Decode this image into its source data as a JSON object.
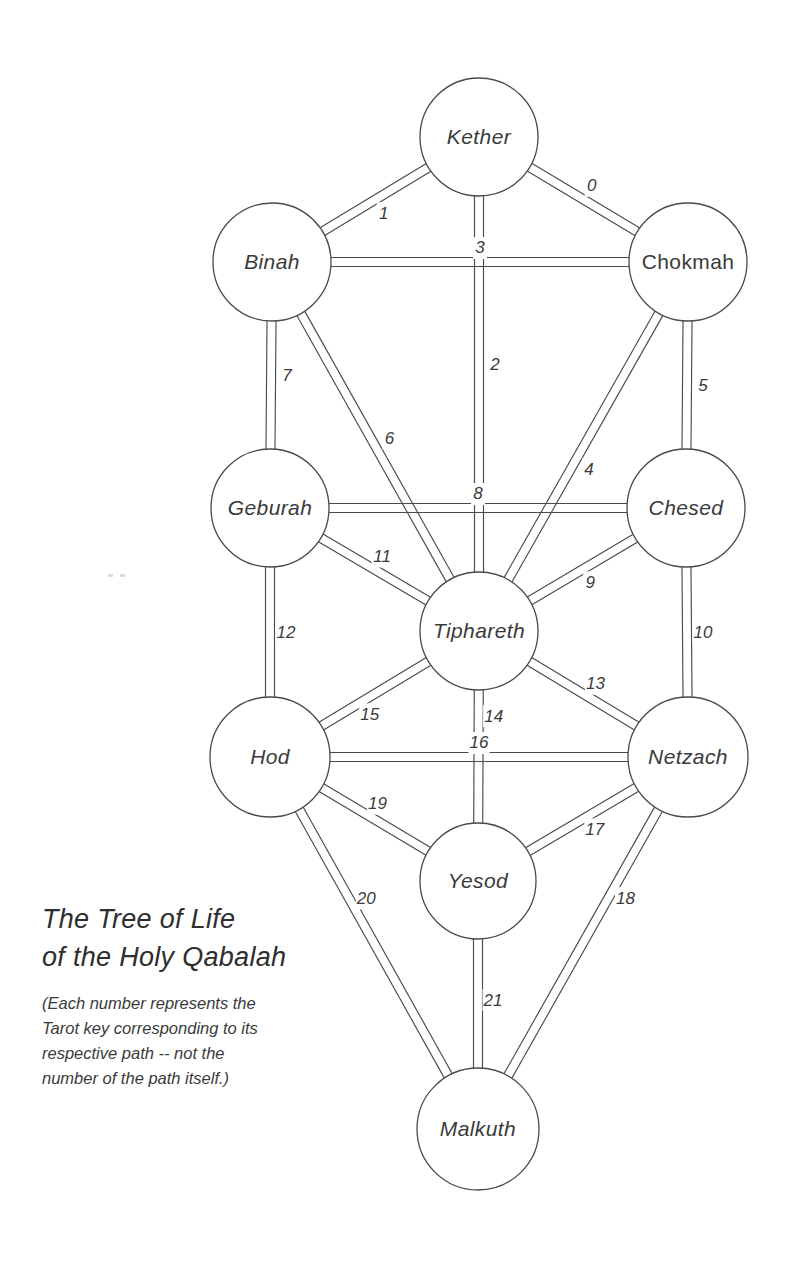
{
  "document": {
    "title_lines": [
      "The Tree of Life",
      "of the Holy Qabalah"
    ],
    "caption_lines": [
      "(Each number represents the",
      "Tarot key corresponding to its",
      "respective path -- not the",
      "number of the path itself.)"
    ]
  },
  "style": {
    "background": "#ffffff",
    "line_color": "#4a4a4a",
    "text_color": "#3a3a3a",
    "rail_gap": 9
  },
  "sephiroth": [
    {
      "id": "kether",
      "label": "Kether",
      "cx": 479,
      "cy": 137,
      "r": 59,
      "italic": true
    },
    {
      "id": "binah",
      "label": "Binah",
      "cx": 272,
      "cy": 262,
      "r": 59,
      "italic": true
    },
    {
      "id": "chokmah",
      "label": "Chokmah",
      "cx": 688,
      "cy": 262,
      "r": 59,
      "italic": false
    },
    {
      "id": "geburah",
      "label": "Geburah",
      "cx": 270,
      "cy": 508,
      "r": 59,
      "italic": true
    },
    {
      "id": "chesed",
      "label": "Chesed",
      "cx": 686,
      "cy": 508,
      "r": 59,
      "italic": true
    },
    {
      "id": "tiphareth",
      "label": "Tiphareth",
      "cx": 479,
      "cy": 631,
      "r": 59,
      "italic": true
    },
    {
      "id": "hod",
      "label": "Hod",
      "cx": 270,
      "cy": 757,
      "r": 60,
      "italic": true
    },
    {
      "id": "netzach",
      "label": "Netzach",
      "cx": 688,
      "cy": 757,
      "r": 60,
      "italic": true
    },
    {
      "id": "yesod",
      "label": "Yesod",
      "cx": 478,
      "cy": 881,
      "r": 58,
      "italic": true
    },
    {
      "id": "malkuth",
      "label": "Malkuth",
      "cx": 478,
      "cy": 1129,
      "r": 61,
      "italic": true
    }
  ],
  "paths": [
    {
      "number": "0",
      "from": "kether",
      "to": "chokmah",
      "lt": 0.5,
      "off": -16
    },
    {
      "number": "1",
      "from": "kether",
      "to": "binah",
      "lt": 0.5,
      "off": -16
    },
    {
      "number": "2",
      "from": "kether",
      "to": "tiphareth",
      "lt": 0.46,
      "off": -16
    },
    {
      "number": "3",
      "from": "binah",
      "to": "chokmah",
      "lt": 0.5,
      "off": -14
    },
    {
      "number": "4",
      "from": "chokmah",
      "to": "tiphareth",
      "lt": 0.54,
      "off": -16
    },
    {
      "number": "5",
      "from": "chokmah",
      "to": "chesed",
      "lt": 0.5,
      "off": -16
    },
    {
      "number": "6",
      "from": "binah",
      "to": "tiphareth",
      "lt": 0.5,
      "off": -16
    },
    {
      "number": "7",
      "from": "binah",
      "to": "geburah",
      "lt": 0.46,
      "off": -16
    },
    {
      "number": "8",
      "from": "geburah",
      "to": "chesed",
      "lt": 0.5,
      "off": -14
    },
    {
      "number": "9",
      "from": "chesed",
      "to": "tiphareth",
      "lt": 0.5,
      "off": -15
    },
    {
      "number": "10",
      "from": "chesed",
      "to": "netzach",
      "lt": 0.5,
      "off": -16
    },
    {
      "number": "11",
      "from": "geburah",
      "to": "tiphareth",
      "lt": 0.5,
      "off": -15
    },
    {
      "number": "12",
      "from": "geburah",
      "to": "hod",
      "lt": 0.5,
      "off": -16
    },
    {
      "number": "13",
      "from": "tiphareth",
      "to": "netzach",
      "lt": 0.52,
      "off": -15
    },
    {
      "number": "14",
      "from": "tiphareth",
      "to": "yesod",
      "lt": 0.34,
      "off": -15
    },
    {
      "number": "15",
      "from": "tiphareth",
      "to": "hod",
      "lt": 0.56,
      "off": -15
    },
    {
      "number": "16",
      "from": "hod",
      "to": "netzach",
      "lt": 0.5,
      "off": -14
    },
    {
      "number": "17",
      "from": "netzach",
      "to": "yesod",
      "lt": 0.48,
      "off": -15
    },
    {
      "number": "18",
      "from": "netzach",
      "to": "malkuth",
      "lt": 0.36,
      "off": -15
    },
    {
      "number": "19",
      "from": "hod",
      "to": "yesod",
      "lt": 0.48,
      "off": -15
    },
    {
      "number": "20",
      "from": "hod",
      "to": "malkuth",
      "lt": 0.4,
      "off": -15
    },
    {
      "number": "21",
      "from": "yesod",
      "to": "malkuth",
      "lt": 0.48,
      "off": -15
    }
  ],
  "layout": {
    "title_x": 42,
    "title_y_first": 928,
    "title_line_height": 38,
    "caption_x": 42,
    "caption_y_first": 1009,
    "caption_line_height": 25
  }
}
